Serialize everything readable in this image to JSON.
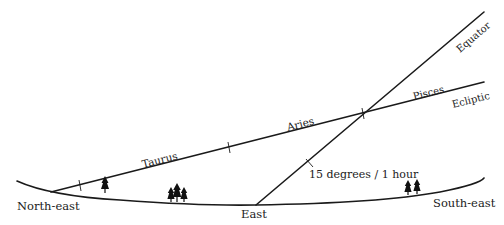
{
  "diagram": {
    "horizon": {
      "labels": {
        "north_east": "North-east",
        "east": "East",
        "south_east": "South-east"
      }
    },
    "lines": {
      "equator": {
        "label": "Equator"
      },
      "ecliptic": {
        "label": "Ecliptic"
      }
    },
    "constellations": [
      {
        "name": "Taurus"
      },
      {
        "name": "Aries"
      },
      {
        "name": "Pisces"
      }
    ],
    "annotation": "15 degrees / 1 hour",
    "colors": {
      "line": "#1a1a1a",
      "text": "#222222",
      "background": "#ffffff"
    }
  }
}
